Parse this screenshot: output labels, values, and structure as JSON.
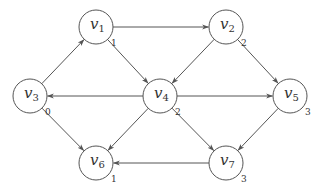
{
  "graph": {
    "type": "directed",
    "nodes": [
      {
        "id": "v1",
        "base": "v",
        "sub": "1",
        "value": "1"
      },
      {
        "id": "v2",
        "base": "v",
        "sub": "2",
        "value": "2"
      },
      {
        "id": "v3",
        "base": "v",
        "sub": "3",
        "value": "0"
      },
      {
        "id": "v4",
        "base": "v",
        "sub": "4",
        "value": "2"
      },
      {
        "id": "v5",
        "base": "v",
        "sub": "5",
        "value": "3"
      },
      {
        "id": "v6",
        "base": "v",
        "sub": "6",
        "value": "1"
      },
      {
        "id": "v7",
        "base": "v",
        "sub": "7",
        "value": "3"
      }
    ],
    "edges": [
      {
        "from": "v3",
        "to": "v1"
      },
      {
        "from": "v1",
        "to": "v2"
      },
      {
        "from": "v1",
        "to": "v4"
      },
      {
        "from": "v2",
        "to": "v4"
      },
      {
        "from": "v2",
        "to": "v5"
      },
      {
        "from": "v4",
        "to": "v3"
      },
      {
        "from": "v4",
        "to": "v5"
      },
      {
        "from": "v3",
        "to": "v6"
      },
      {
        "from": "v4",
        "to": "v6"
      },
      {
        "from": "v4",
        "to": "v7"
      },
      {
        "from": "v5",
        "to": "v7"
      },
      {
        "from": "v7",
        "to": "v6"
      }
    ],
    "colors": {
      "stroke": "#555555",
      "text": "#333333",
      "background": "#ffffff"
    }
  }
}
